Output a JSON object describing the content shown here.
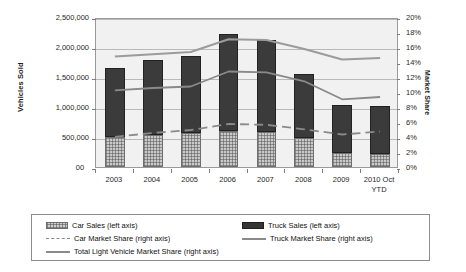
{
  "chart_data": {
    "type": "bar",
    "title": "",
    "subtitle": "",
    "xlabel": "",
    "ylabel": "Vehicles Sold",
    "y2label": "Market Share",
    "grid": true,
    "legend_position": "bottom",
    "categories": [
      "2003",
      "2004",
      "2005",
      "2006",
      "2007",
      "2008",
      "2009",
      "2010 Oct\nYTD"
    ],
    "category_labels_raw": [
      "2003",
      "2004",
      "2005",
      "2006",
      "2007",
      "2008",
      "2009",
      "2010 Oct YTD"
    ],
    "ylim": [
      0,
      2500000
    ],
    "yticks": [
      0,
      500000,
      1000000,
      1500000,
      2000000,
      2500000
    ],
    "ytick_labels": [
      "0",
      "500,000",
      "1,000,000",
      "1,500,000",
      "2,000,000",
      "2,500,000"
    ],
    "y2lim": [
      0,
      20
    ],
    "y2ticks": [
      0,
      2,
      4,
      6,
      8,
      10,
      12,
      14,
      16,
      18,
      20
    ],
    "y2tick_labels": [
      "0%",
      "2%",
      "4%",
      "6%",
      "8%",
      "10%",
      "12%",
      "14%",
      "16%",
      "18%",
      "20%"
    ],
    "stacked": true,
    "series": [
      {
        "name": "Car Sales (left axis)",
        "type": "bar",
        "axis": "left",
        "stack": "sales",
        "color": "#c9c9c9",
        "pattern": "hatched",
        "values": [
          500000,
          530000,
          560000,
          600000,
          590000,
          490000,
          230000,
          225000
        ]
      },
      {
        "name": "Truck Sales (left axis)",
        "type": "bar",
        "axis": "left",
        "stack": "sales",
        "color": "#3b3b3b",
        "pattern": "solid",
        "values": [
          1150000,
          1250000,
          1290000,
          1610000,
          1520000,
          1060000,
          800000,
          800000
        ]
      },
      {
        "name": "Car Market Share (right axis)",
        "type": "line",
        "axis": "right",
        "color": "#8a8a8a",
        "dash": "dashed",
        "values": [
          4.3,
          4.8,
          5.2,
          6.0,
          5.9,
          5.3,
          4.6,
          5.0
        ]
      },
      {
        "name": "Truck Market Share (right axis)",
        "type": "line",
        "axis": "right",
        "color": "#8a8a8a",
        "dash": "solid",
        "values": [
          10.5,
          10.8,
          11.0,
          13.0,
          12.9,
          11.7,
          9.3,
          9.6
        ]
      },
      {
        "name": "Total Light Vehicle Market Share (right axis)",
        "type": "line",
        "axis": "right",
        "color": "#9b9b9b",
        "dash": "solid",
        "values": [
          15.0,
          15.3,
          15.6,
          17.3,
          17.2,
          16.0,
          14.6,
          14.8
        ]
      }
    ],
    "stack_totals": [
      1650000,
      1780000,
      1850000,
      2210000,
      2110000,
      1550000,
      1030000,
      1025000
    ]
  },
  "legend": {
    "entries": [
      {
        "label": "Car Sales (left axis)",
        "marker": "swatch-hatched"
      },
      {
        "label": "Truck Sales (left axis)",
        "marker": "swatch-solid-dark"
      },
      {
        "label": "Car Market Share (right axis)",
        "marker": "line-dashed"
      },
      {
        "label": "Truck Market Share (right axis)",
        "marker": "line-solid"
      },
      {
        "label": "Total Light Vehicle Market Share (right axis)",
        "marker": "line-solid"
      }
    ]
  },
  "colors": {
    "truck_bar": "#3b3b3b",
    "car_bar": "#c9c9c9",
    "line_gray": "#8a8a8a",
    "plot_bg": "#f1f1f1",
    "grid": "#b9b9b9",
    "frame": "#9a9a9a",
    "text": "#1f1f1f"
  }
}
